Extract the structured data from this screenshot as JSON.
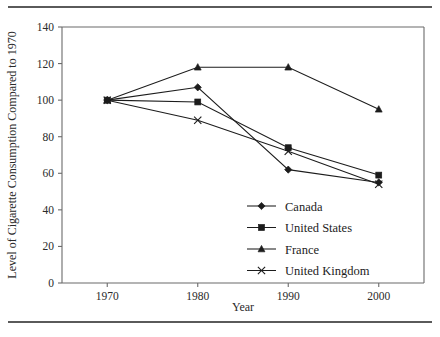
{
  "chart_data": {
    "type": "line",
    "title": "",
    "xlabel": "Year",
    "ylabel": "Level of Cigarette Consumption Compared to 1970",
    "x": [
      1970,
      1980,
      1990,
      2000
    ],
    "xticklabels": [
      "1970",
      "1980",
      "1990",
      "2000"
    ],
    "yticks": [
      0,
      20,
      40,
      60,
      80,
      100,
      120,
      140
    ],
    "yticklabels": [
      "0",
      "20",
      "40",
      "60",
      "80",
      "100",
      "120",
      "140"
    ],
    "xlim": [
      1965,
      2005
    ],
    "ylim": [
      0,
      140
    ],
    "grid": false,
    "legend_position": "inside-lower-right",
    "series": [
      {
        "name": "Canada",
        "marker": "diamond",
        "values": [
          100,
          107,
          62,
          55
        ]
      },
      {
        "name": "United States",
        "marker": "square",
        "values": [
          100,
          99,
          74,
          59
        ]
      },
      {
        "name": "France",
        "marker": "triangle",
        "values": [
          100,
          118,
          118,
          95
        ]
      },
      {
        "name": "United Kingdom",
        "marker": "x",
        "values": [
          100,
          89,
          72,
          54
        ]
      }
    ]
  },
  "axes": {
    "x_title": "Year",
    "y_title": "Level of Cigarette Consumption Compared to 1970"
  },
  "legend": {
    "entries": [
      {
        "label": "Canada",
        "marker": "diamond"
      },
      {
        "label": "United States",
        "marker": "square"
      },
      {
        "label": "France",
        "marker": "triangle"
      },
      {
        "label": "United Kingdom",
        "marker": "x"
      }
    ]
  },
  "colors": {
    "ink": "#1c1c1c",
    "axis": "#6b6b6b",
    "rule": "#5a5a5a",
    "background": "#ffffff"
  }
}
